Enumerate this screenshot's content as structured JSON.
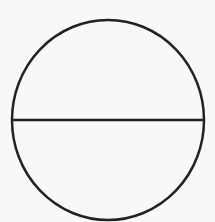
{
  "diagram": {
    "type": "geometric-figure",
    "shapes": [
      {
        "kind": "circle",
        "cx": 108,
        "cy": 120,
        "rx": 96,
        "ry": 100
      },
      {
        "kind": "diameter",
        "orientation": "horizontal",
        "x1": 12,
        "x2": 204,
        "y": 120
      }
    ],
    "colors": {
      "background": "#f8f8f8",
      "stroke": "#222222"
    },
    "stroke_width": 2.5
  }
}
